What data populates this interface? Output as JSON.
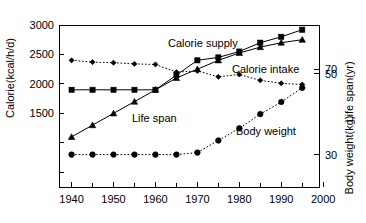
{
  "chart_data": {
    "type": "line",
    "title": "",
    "xlabel": "",
    "x": [
      1940,
      1945,
      1950,
      1955,
      1960,
      1965,
      1970,
      1975,
      1980,
      1985,
      1990,
      1995
    ],
    "xlim": [
      1937,
      1999
    ],
    "xticks": [
      1940,
      1950,
      1960,
      1970,
      1980,
      1990,
      2000
    ],
    "xtick_labels": [
      "1940",
      "1950",
      "1960",
      "1970",
      "1980",
      "1990",
      "2000"
    ],
    "xminor_ticks": [
      1945,
      1955,
      1965,
      1975,
      1985,
      1995
    ],
    "grid": false,
    "legend_position": "inline-annotations",
    "axes": [
      {
        "id": "left",
        "label": "Calorie(kcal/h/d)",
        "ticks": [
          3000,
          2500,
          2000,
          1500
        ],
        "tick_labels": [
          "3000",
          "2500",
          "2000",
          "1500"
        ],
        "unlabeled_ticks": [
          1000,
          500
        ],
        "ylim": [
          250,
          3000
        ]
      },
      {
        "id": "right-lifespan",
        "label": "Life span(yr)",
        "ticks": [
          70
        ],
        "tick_labels": [
          "70"
        ],
        "ylim": [
          30,
          85
        ]
      },
      {
        "id": "right-bodyweight",
        "label": "Body weight(kg)",
        "ticks": [
          50,
          30
        ],
        "tick_labels": [
          "50",
          "30"
        ],
        "ylim": [
          22,
          62
        ]
      }
    ],
    "series": [
      {
        "name": "Calorie supply",
        "axis": "left",
        "marker": "square",
        "line_style": "solid",
        "label_text": "Calorie supply",
        "values": [
          1900,
          1900,
          1900,
          1900,
          1900,
          2150,
          2400,
          2450,
          2550,
          2700,
          2800,
          2920
        ]
      },
      {
        "name": "Calorie intake",
        "axis": "left",
        "marker": "diamond",
        "line_style": "dotted",
        "label_text": "Calorie intake",
        "values": [
          2400,
          2370,
          2360,
          2340,
          2330,
          2200,
          2220,
          2120,
          2160,
          2060,
          2010,
          1990
        ]
      },
      {
        "name": "Life span",
        "axis": "right-lifespan",
        "marker": "triangle",
        "line_style": "solid",
        "label_text": "Life span",
        "values": [
          47.0,
          51.0,
          55.0,
          59.0,
          63.0,
          67.0,
          70.0,
          73.0,
          75.5,
          77.5,
          79.0,
          80.0
        ]
      },
      {
        "name": "Body weight",
        "axis": "right-bodyweight",
        "marker": "circle",
        "line_style": "dotted",
        "label_text": "Body weight",
        "values": [
          30.0,
          30.0,
          30.0,
          30.0,
          30.0,
          30.0,
          30.5,
          33.5,
          36.5,
          40.0,
          43.0,
          46.5
        ]
      }
    ]
  }
}
